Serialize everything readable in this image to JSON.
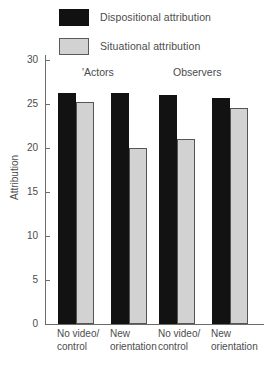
{
  "legend": {
    "items": [
      {
        "label": "Dispositional attribution",
        "swatch": "black",
        "color": "#121212"
      },
      {
        "label": "Situational attribution",
        "swatch": "gray",
        "color": "#d2d2d2"
      }
    ]
  },
  "axis": {
    "ylabel": "Attribution",
    "yticks": [
      "30",
      "25",
      "20",
      "15",
      "10",
      "5",
      "0"
    ]
  },
  "groups": {
    "actors": "'Actors",
    "observers": "Observers"
  },
  "xlabels": [
    {
      "line1": "No video/",
      "line2": "control"
    },
    {
      "line1": "New",
      "line2": "orientation"
    },
    {
      "line1": "No video/",
      "line2": "control"
    },
    {
      "line1": "New",
      "line2": "orientation"
    }
  ],
  "chart_data": {
    "type": "bar",
    "title": "",
    "xlabel": "",
    "ylabel": "Attribution",
    "ylim": [
      0,
      30
    ],
    "yticks": [
      0,
      5,
      10,
      15,
      20,
      25,
      30
    ],
    "grid": false,
    "legend_position": "top",
    "categories": [
      "No video/ control",
      "New orientation",
      "No video/ control",
      "New orientation"
    ],
    "group_headers": [
      "'Actors",
      "Observers"
    ],
    "series": [
      {
        "name": "Dispositional attribution",
        "color": "#121212",
        "values": [
          26.2,
          26.2,
          26.0,
          25.7
        ]
      },
      {
        "name": "Situational attribution",
        "color": "#d2d2d2",
        "values": [
          25.2,
          20.0,
          21.0,
          24.6
        ]
      }
    ]
  }
}
